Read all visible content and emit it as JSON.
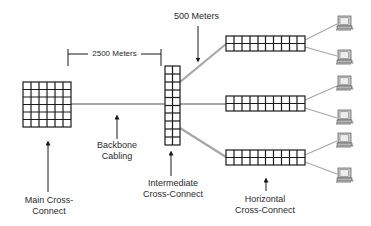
{
  "diagram": {
    "colors": {
      "panel_line": "#1a1a1a",
      "cable": "#a6a6a6",
      "arrow": "#1a1a1a",
      "text": "#2b2b2b",
      "computer_body": "#c8c8c8",
      "computer_screen": "#e6e6e6"
    },
    "labels": {
      "distance_backbone": "2500 Meters",
      "distance_horizontal": "500 Meters",
      "backbone_line1": "Backbone",
      "backbone_line2": "Cabling",
      "main_line1": "Main Cross-",
      "main_line2": "Connect",
      "intermediate_line1": "Intermediate",
      "intermediate_line2": "Cross-Connect",
      "horizontal_line1": "Horizontal",
      "horizontal_line2": "Cross-Connect"
    },
    "nodes": {
      "main_cross_connect": {
        "label": "Main Cross-Connect",
        "cols": 6,
        "rows": 6
      },
      "intermediate_cross_connect": {
        "label": "Intermediate Cross-Connect",
        "cols": 2,
        "rows": 10
      },
      "horizontal_cross_connects": [
        {
          "label": "Horizontal Cross-Connect 1",
          "cols": 10,
          "rows": 2
        },
        {
          "label": "Horizontal Cross-Connect 2",
          "cols": 10,
          "rows": 2
        },
        {
          "label": "Horizontal Cross-Connect 3",
          "cols": 10,
          "rows": 2
        }
      ],
      "workstations": [
        {
          "icon": "computer-icon"
        },
        {
          "icon": "computer-icon"
        },
        {
          "icon": "computer-icon"
        },
        {
          "icon": "computer-icon"
        },
        {
          "icon": "computer-icon"
        },
        {
          "icon": "computer-icon"
        }
      ]
    }
  }
}
